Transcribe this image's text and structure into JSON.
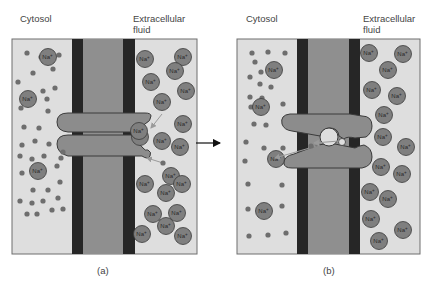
{
  "panels": [
    {
      "id": "a",
      "caption": "(a)",
      "left_label": "Cytosol",
      "right_label_line1": "Extracellular",
      "right_label_line2": "fluid",
      "box": {
        "x": 12,
        "y": 39,
        "w": 185,
        "h": 215
      },
      "membrane": {
        "band1_x": 72,
        "band2_x": 123,
        "band_w": 12
      },
      "channel_state": "closed",
      "cytosol_na_ions": [
        [
          48,
          57
        ],
        [
          28,
          99
        ],
        [
          38,
          171
        ]
      ],
      "cytosol_dots": [
        [
          27,
          53
        ],
        [
          41,
          57
        ],
        [
          59,
          55
        ],
        [
          33,
          73
        ],
        [
          53,
          69
        ],
        [
          18,
          82
        ],
        [
          31,
          95
        ],
        [
          43,
          91
        ],
        [
          55,
          88
        ],
        [
          21,
          108
        ],
        [
          47,
          99
        ],
        [
          48,
          111
        ],
        [
          24,
          127
        ],
        [
          39,
          128
        ],
        [
          22,
          145
        ],
        [
          35,
          141
        ],
        [
          49,
          144
        ],
        [
          63,
          152
        ],
        [
          20,
          156
        ],
        [
          32,
          159
        ],
        [
          44,
          156
        ],
        [
          61,
          158
        ],
        [
          22,
          173
        ],
        [
          57,
          166
        ],
        [
          33,
          190
        ],
        [
          48,
          190
        ],
        [
          60,
          182
        ],
        [
          20,
          201
        ],
        [
          32,
          203
        ],
        [
          43,
          201
        ],
        [
          58,
          198
        ],
        [
          27,
          214
        ],
        [
          37,
          214
        ],
        [
          52,
          210
        ],
        [
          63,
          209
        ]
      ],
      "extracellular_na_ions": [
        [
          145,
          59
        ],
        [
          183,
          57
        ],
        [
          175,
          71
        ],
        [
          151,
          82
        ],
        [
          186,
          91
        ],
        [
          162,
          102
        ],
        [
          183,
          124
        ],
        [
          140,
          137
        ],
        [
          162,
          141
        ],
        [
          180,
          147
        ],
        [
          171,
          176
        ],
        [
          145,
          184
        ],
        [
          182,
          184
        ],
        [
          166,
          193
        ],
        [
          153,
          214
        ],
        [
          177,
          213
        ],
        [
          142,
          234
        ],
        [
          166,
          226
        ],
        [
          183,
          236
        ]
      ],
      "moving_na_ion": [
        139,
        131
      ],
      "arrows": [
        {
          "from": [
            162,
            114
          ],
          "to": [
            151,
            128
          ]
        },
        {
          "from": [
            163,
            163
          ],
          "to": [
            147,
            158
          ]
        }
      ],
      "small_dot_ext": [
        163,
        163
      ]
    },
    {
      "id": "b",
      "caption": "(b)",
      "left_label": "Cytosol",
      "right_label_line1": "Extracellular",
      "right_label_line2": "fluid",
      "box": {
        "x": 237,
        "y": 39,
        "w": 183,
        "h": 215
      },
      "membrane": {
        "band1_x": 297,
        "band2_x": 349,
        "band_w": 12
      },
      "channel_state": "open",
      "cytosol_na_ions": [
        [
          274,
          70
        ],
        [
          261,
          107
        ],
        [
          276,
          159
        ],
        [
          264,
          211
        ]
      ],
      "cytosol_dots": [
        [
          252,
          53
        ],
        [
          268,
          52
        ],
        [
          285,
          53
        ],
        [
          255,
          62
        ],
        [
          261,
          72
        ],
        [
          250,
          77
        ],
        [
          260,
          84
        ],
        [
          271,
          87
        ],
        [
          250,
          97
        ],
        [
          262,
          98
        ],
        [
          251,
          107
        ],
        [
          283,
          104
        ],
        [
          254,
          124
        ],
        [
          266,
          125
        ],
        [
          246,
          142
        ],
        [
          264,
          148
        ],
        [
          283,
          148
        ],
        [
          245,
          161
        ],
        [
          282,
          162
        ],
        [
          248,
          184
        ],
        [
          282,
          185
        ],
        [
          248,
          209
        ],
        [
          282,
          206
        ],
        [
          249,
          236
        ],
        [
          268,
          235
        ],
        [
          286,
          233
        ]
      ],
      "extracellular_na_ions": [
        [
          369,
          53
        ],
        [
          403,
          54
        ],
        [
          388,
          70
        ],
        [
          372,
          90
        ],
        [
          397,
          96
        ],
        [
          384,
          115
        ],
        [
          383,
          137
        ],
        [
          406,
          147
        ],
        [
          381,
          167
        ],
        [
          402,
          174
        ],
        [
          370,
          192
        ],
        [
          388,
          199
        ],
        [
          371,
          219
        ],
        [
          403,
          230
        ],
        [
          379,
          241
        ]
      ],
      "arrows": [
        {
          "from": [
            320,
            145
          ],
          "to": [
            275,
            158
          ]
        },
        {
          "from": [
            339,
            141
          ],
          "to": [
            314,
            143
          ]
        }
      ],
      "channel_dot": [
        311,
        146
      ]
    }
  ],
  "transition_arrow": {
    "from": [
      196,
      143
    ],
    "to": [
      221,
      143
    ]
  },
  "ion_label": "Na+",
  "colors": {
    "panel_bg": "#dedede",
    "panel_border": "#6e6e6e",
    "membrane_dark": "#262626",
    "membrane_core": "#8f8f8f",
    "channel": "#8c8c8c",
    "channel_outline": "#3a3a3a",
    "ion_fill": "#7f7f7f",
    "ion_outline": "#3a3a3a",
    "dot_fill": "#6e6e6e",
    "arrow_light": "#9a9a9a"
  }
}
